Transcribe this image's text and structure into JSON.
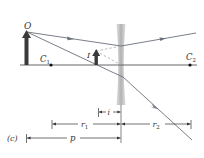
{
  "diagram": {
    "panel_label": "(c)",
    "object_label": "O",
    "image_label": "I",
    "center_left_label": "C",
    "center_left_sub": "1",
    "center_right_label": "C",
    "center_right_sub": "2",
    "dimensions": {
      "i": "i",
      "r1": "r",
      "r1_sub": "1",
      "r2": "r",
      "r2_sub": "2",
      "p": "p"
    },
    "colors": {
      "axis": "#555555",
      "object_arrow": "#3a3a3a",
      "ray": "#6a6f7a",
      "lens": "#b9b9b9",
      "dashed": "#a9a9a9"
    }
  }
}
